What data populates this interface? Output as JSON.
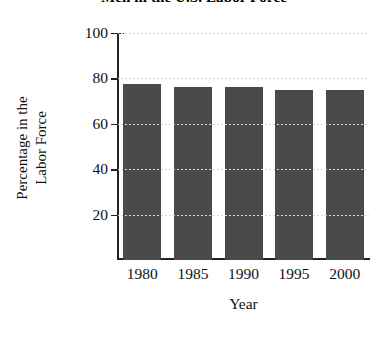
{
  "chart_data": {
    "type": "bar",
    "title": "Men in the U.S. Labor Force",
    "xlabel": "Year",
    "ylabel": "Percentage in the Labor Force",
    "ylabel_lines": [
      "Percentage in the",
      "Labor Force"
    ],
    "categories": [
      "1980",
      "1985",
      "1990",
      "1995",
      "2000"
    ],
    "values": [
      77.4,
      76.3,
      76.4,
      75.0,
      74.7
    ],
    "ylim": [
      0,
      100
    ],
    "yticks": [
      20,
      40,
      60,
      80,
      100
    ],
    "ytick_labels": [
      "20",
      "40",
      "60",
      "80",
      "100"
    ],
    "xlim_note": "categorical",
    "grid": "dotted horizontal gridlines at y ticks",
    "legend": "none",
    "bar_color": "#4a4a4a",
    "axis_color": "#222222",
    "background": "#ffffff",
    "series": [
      {
        "name": "Men in the U.S. Labor Force",
        "values": [
          77.4,
          76.3,
          76.4,
          75.0,
          74.7
        ]
      }
    ]
  }
}
